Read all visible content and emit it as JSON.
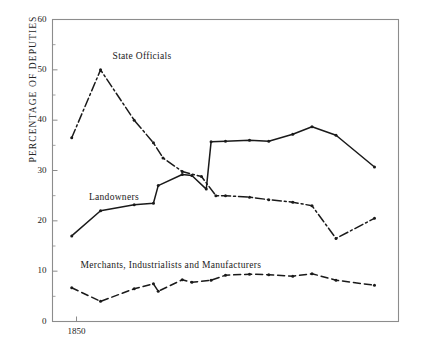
{
  "axes": {
    "ylabel": "PERCENTAGE OF DEPUTIES",
    "yticks": [
      0,
      10,
      20,
      30,
      40,
      50,
      60
    ],
    "ylim": [
      0,
      60
    ],
    "xticks": [
      1850,
      1860,
      1870,
      1880,
      1890,
      1900,
      1910
    ],
    "xminor_step": 5,
    "xlim": [
      1845,
      1917
    ],
    "grid": false,
    "frame": "box"
  },
  "labels": {
    "state_officials": "State  Officials",
    "landowners": "Landowners",
    "merchants": "Merchants, Industrialists  and  Manufacturers"
  },
  "colors": {
    "line": "#1a1a1a",
    "frame": "#8c8c8c",
    "background": "#ffffff"
  },
  "chart_data": {
    "type": "line",
    "title": "",
    "xlabel": "",
    "ylabel": "PERCENTAGE OF DEPUTIES",
    "xlim": [
      1845,
      1917
    ],
    "ylim": [
      0,
      60
    ],
    "xticks": [
      1850,
      1860,
      1870,
      1880,
      1890,
      1900,
      1910
    ],
    "yticks": [
      0,
      10,
      20,
      30,
      40,
      50,
      60
    ],
    "grid": false,
    "legend": "inline-labels",
    "series": [
      {
        "name": "State  Officials",
        "style": "dash-dot",
        "marker": "dot",
        "points": [
          [
            1849,
            36.5
          ],
          [
            1855,
            50.0
          ],
          [
            1862,
            40.0
          ],
          [
            1866,
            35.5
          ],
          [
            1868,
            32.5
          ],
          [
            1872,
            29.8
          ],
          [
            1876,
            28.8
          ],
          [
            1879,
            25.0
          ],
          [
            1881,
            25.0
          ],
          [
            1886,
            24.7
          ],
          [
            1890,
            24.2
          ],
          [
            1895,
            23.7
          ],
          [
            1899,
            23.0
          ],
          [
            1904,
            16.5
          ],
          [
            1912,
            20.5
          ]
        ]
      },
      {
        "name": "Landowners",
        "style": "solid",
        "marker": "dot",
        "points": [
          [
            1849,
            17.0
          ],
          [
            1855,
            22.0
          ],
          [
            1862,
            23.2
          ],
          [
            1866,
            23.5
          ],
          [
            1867,
            27.0
          ],
          [
            1872,
            29.2
          ],
          [
            1874,
            29.0
          ],
          [
            1877,
            26.3
          ],
          [
            1878,
            35.7
          ],
          [
            1881,
            35.8
          ],
          [
            1886,
            36.0
          ],
          [
            1890,
            35.8
          ],
          [
            1895,
            37.2
          ],
          [
            1899,
            38.7
          ],
          [
            1904,
            37.0
          ],
          [
            1912,
            30.7
          ]
        ]
      },
      {
        "name": "Merchants, Industrialists  and  Manufacturers",
        "style": "dashed",
        "marker": "dot",
        "points": [
          [
            1849,
            6.7
          ],
          [
            1855,
            4.0
          ],
          [
            1862,
            6.5
          ],
          [
            1866,
            7.5
          ],
          [
            1867,
            6.0
          ],
          [
            1872,
            8.3
          ],
          [
            1874,
            7.8
          ],
          [
            1878,
            8.2
          ],
          [
            1881,
            9.2
          ],
          [
            1886,
            9.4
          ],
          [
            1890,
            9.3
          ],
          [
            1895,
            9.0
          ],
          [
            1899,
            9.5
          ],
          [
            1904,
            8.2
          ],
          [
            1912,
            7.2
          ]
        ]
      }
    ]
  }
}
